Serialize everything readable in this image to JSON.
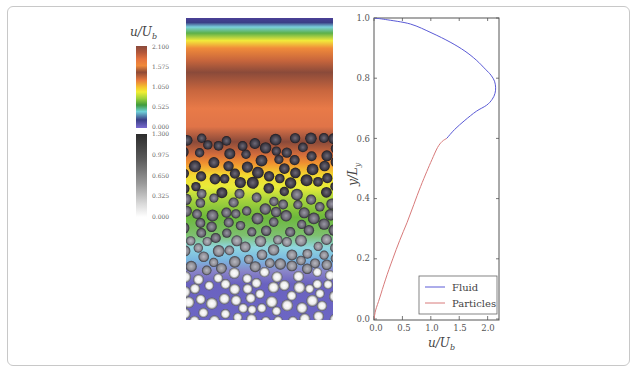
{
  "figure": {
    "colorbar_fluid": {
      "title": "u/U_b",
      "title_main": "u/U",
      "title_sub": "b",
      "ticks": [
        "2.100",
        "1.575",
        "1.050",
        "0.525",
        "0.000"
      ],
      "colors_top_to_bottom": [
        "#8a4a3c",
        "#b3573a",
        "#e4733f",
        "#f08a3a",
        "#8f4a36",
        "#e87a3e",
        "#f5c22c",
        "#f2ee34",
        "#9ed23a",
        "#3f9a3c",
        "#6fd0d8",
        "#3a3f86",
        "#7a6bd0"
      ]
    },
    "colorbar_particles": {
      "ticks": [
        "1.300",
        "0.975",
        "0.650",
        "0.325",
        "0.000"
      ],
      "colors_top_to_bottom": [
        "#2c2c2c",
        "#5a5a5a",
        "#8e8e8e",
        "#c9c9c9",
        "#ffffff"
      ]
    },
    "simulation_panel": {
      "description": "Fluid velocity field with suspended particles"
    }
  },
  "chart_data": {
    "type": "line",
    "title": "",
    "xlabel": "u/U_b",
    "xlabel_main": "u/U",
    "xlabel_sub": "b",
    "ylabel": "y/L_y",
    "ylabel_main": "y/L",
    "ylabel_sub": "y",
    "xlim": [
      0,
      2.2
    ],
    "ylim": [
      0,
      1.0
    ],
    "xticks": [
      "0.0",
      "0.5",
      "1.0",
      "1.5",
      "2.0"
    ],
    "yticks": [
      "0.0",
      "0.2",
      "0.4",
      "0.6",
      "0.8",
      "1.0"
    ],
    "grid": false,
    "legend_position": "lower right",
    "series": [
      {
        "name": "Fluid",
        "color": "#5a5ad6",
        "x": [
          1.28,
          1.42,
          1.6,
          1.8,
          1.98,
          2.08,
          2.13,
          2.14,
          2.12,
          2.06,
          1.96,
          1.8,
          1.6,
          1.34,
          1.02,
          0.64,
          0.2,
          0.0
        ],
        "y": [
          0.6,
          0.63,
          0.66,
          0.69,
          0.71,
          0.73,
          0.75,
          0.77,
          0.79,
          0.81,
          0.83,
          0.86,
          0.89,
          0.92,
          0.95,
          0.98,
          0.995,
          1.0
        ]
      },
      {
        "name": "Particles",
        "color": "#d87a7a",
        "x": [
          0.0,
          0.03,
          0.1,
          0.2,
          0.33,
          0.45,
          0.58,
          0.7,
          0.82,
          0.93,
          1.02,
          1.12,
          1.2,
          1.28
        ],
        "y": [
          0.0,
          0.03,
          0.07,
          0.13,
          0.2,
          0.26,
          0.32,
          0.38,
          0.44,
          0.49,
          0.53,
          0.57,
          0.59,
          0.6
        ]
      }
    ],
    "legend": [
      "Fluid",
      "Particles"
    ]
  }
}
